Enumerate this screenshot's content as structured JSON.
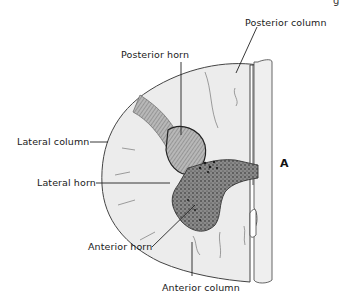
{
  "diagram": {
    "labels": {
      "posterior_column": "Posterior column",
      "posterior_horn": "Posterior horn",
      "lateral_column": "Lateral column",
      "lateral_horn": "Lateral horn",
      "anterior_horn": "Anterior horn",
      "anterior_column": "Anterior column",
      "marker": "A",
      "corner_fragment": "g"
    },
    "colors": {
      "white_matter": "#ececec",
      "gray_matter": "#5a5a5a",
      "outline": "#444444",
      "leader_line": "#222222",
      "text": "#1a1a1a"
    }
  }
}
